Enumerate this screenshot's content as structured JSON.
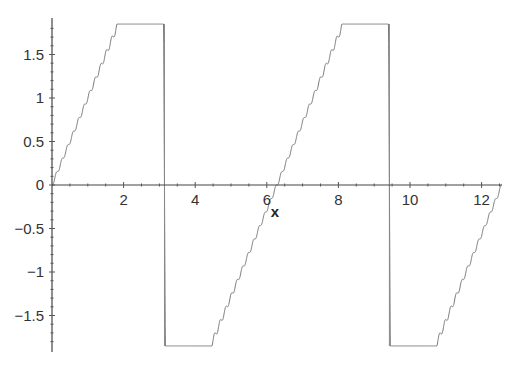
{
  "chart_data": {
    "type": "line",
    "title": "",
    "xlabel": "x",
    "ylabel": "",
    "xlim": [
      0,
      12.566
    ],
    "ylim": [
      -1.85,
      1.85
    ],
    "grid": false,
    "legend": null,
    "x_ticks": [
      2,
      4,
      6,
      8,
      10,
      12
    ],
    "x_tick_labels": [
      "2",
      "4",
      "6",
      "8",
      "10",
      "12"
    ],
    "y_ticks": [
      1.5,
      1,
      0.5,
      0,
      -0.5,
      -1,
      -1.5
    ],
    "y_tick_labels": [
      "1.5",
      "1",
      "0.5",
      "0",
      "-0.5",
      "-1",
      "-1.5"
    ],
    "series": [
      {
        "name": "Fourier partial sum of sawtooth f(x)=x on (-π,π), period 2π",
        "description": "Linear ramp from 0 to ~π with Gibbs oscillations near discontinuities at x=π and x=3π; vertical jumps from ~+1.85 to ~-1.85",
        "harmonics": 40,
        "x_range": [
          0,
          12.566
        ],
        "discontinuities": [
          3.1416,
          9.4248
        ],
        "approx_peak": 1.6,
        "approx_trough": -1.6,
        "color": "#777777"
      }
    ]
  },
  "axes": {
    "x_axis_label": "x",
    "origin_label": "0"
  }
}
